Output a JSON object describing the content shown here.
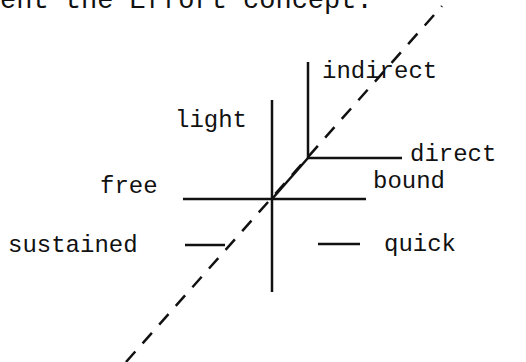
{
  "heading_fragment": "ent the Effort concept.",
  "diagram": {
    "labels": {
      "indirect": "indirect",
      "direct": "direct",
      "light": "light",
      "free": "free",
      "bound": "bound",
      "sustained": "sustained",
      "quick": "quick"
    }
  }
}
